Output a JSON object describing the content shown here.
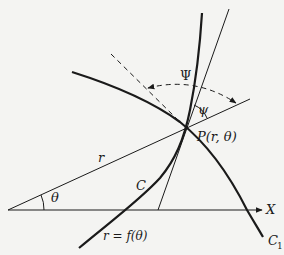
{
  "figure": {
    "labels": {
      "psi_upper": "Ψ",
      "psi_lower": "ψ",
      "point": "P(r, θ)",
      "radius": "r",
      "theta": "θ",
      "curve_c": "C",
      "curve_c1": "C",
      "curve_c1_sub": "1",
      "x_axis": "X",
      "equation": "r = f(θ)"
    },
    "colors": {
      "ink": "#1a1a1a",
      "background": "#f4f4f2"
    }
  }
}
